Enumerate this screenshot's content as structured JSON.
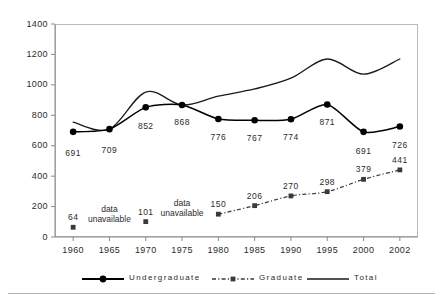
{
  "chart_data": {
    "type": "line",
    "title": "",
    "subtitle": "",
    "xlabel": "",
    "ylabel": "",
    "categories": [
      "1960",
      "1965",
      "1970",
      "1975",
      "1980",
      "1985",
      "1990",
      "1995",
      "2000",
      "2002"
    ],
    "ylim": [
      0,
      1400
    ],
    "yticks": [
      0,
      200,
      400,
      600,
      800,
      1000,
      1200,
      1400
    ],
    "grid": false,
    "legend_position": "bottom",
    "series": [
      {
        "name": "Undergraduate",
        "marker": "circle",
        "line_style": "solid",
        "color": "#000000",
        "values": [
          691,
          709,
          852,
          868,
          776,
          767,
          774,
          871,
          691,
          726
        ],
        "labels": [
          "691",
          "709",
          "852",
          "868",
          "776",
          "767",
          "774",
          "871",
          "691",
          "726"
        ]
      },
      {
        "name": "Graduate",
        "marker": "square",
        "line_style": "dash-dot",
        "color": "#3a3a3a",
        "values": [
          64,
          null,
          101,
          null,
          150,
          206,
          270,
          298,
          379,
          441
        ],
        "labels": [
          "64",
          "",
          "101",
          "",
          "150",
          "206",
          "270",
          "298",
          "379",
          "441"
        ],
        "missing_note": "data\nunavailable",
        "missing_at": [
          "1965",
          "1975"
        ]
      },
      {
        "name": "Total",
        "marker": "none",
        "line_style": "solid-smooth",
        "color": "#1a1a1a",
        "values": [
          755,
          709,
          953,
          868,
          926,
          973,
          1044,
          1170,
          1070,
          1170
        ]
      }
    ]
  },
  "axes": {
    "y_tick_labels": [
      "1400",
      "1200",
      "1000",
      "800",
      "600",
      "400",
      "200",
      "0"
    ],
    "x_tick_labels": [
      "1960",
      "1965",
      "1970",
      "1975",
      "1980",
      "1985",
      "1990",
      "1995",
      "2000",
      "2002"
    ]
  },
  "legend": {
    "items": [
      {
        "label": "Undergraduate",
        "key": "line-circle-solid"
      },
      {
        "label": "Graduate",
        "key": "line-square-dashdot"
      },
      {
        "label": "Total",
        "key": "line-plain-solid"
      }
    ]
  },
  "annotations": {
    "data_unavailable_line1": "data",
    "data_unavailable_line2": "unavailable"
  }
}
